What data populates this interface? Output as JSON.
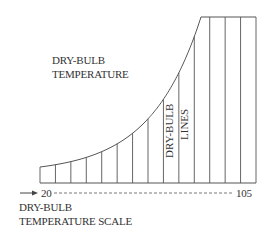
{
  "diagram": {
    "title_label_line1": "DRY-BULB",
    "title_label_line2": "TEMPERATURE",
    "lines_label_line1": "DRY-BULB",
    "lines_label_line2": "LINES",
    "scale_label_line1": "DRY-BULB",
    "scale_label_line2": "TEMPERATURE SCALE",
    "scale_start": "20",
    "scale_end": "105",
    "scale_arrow_icon": "right-arrow-icon",
    "vertical_line_count": 15,
    "line_color": "#555555"
  }
}
